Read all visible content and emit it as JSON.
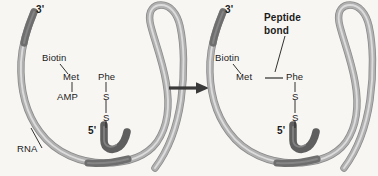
{
  "figure": {
    "background_color": "#f7f6f3",
    "strand_color": "#a9a9a9",
    "strand_highlight_color": "#d8d8d8",
    "strand_dark_color": "#6e6e6e",
    "text_color": "#1b1b1b",
    "arrow_color": "#3a3a3a"
  },
  "arrow": {
    "name": "reaction-arrow",
    "direction": "right"
  },
  "panels": {
    "left": {
      "name": "before-peptide-bond-panel",
      "labels": {
        "three_prime": "3'",
        "five_prime": "5'",
        "rna": "RNA",
        "biotin": "Biotin",
        "met": "Met",
        "amp": "AMP",
        "phe": "Phe",
        "sulfur_upper": "S",
        "sulfur_lower": "S"
      }
    },
    "right": {
      "name": "after-peptide-bond-panel",
      "labels": {
        "three_prime": "3'",
        "five_prime": "5'",
        "peptide_bond_line1": "Peptide",
        "peptide_bond_line2": "bond",
        "biotin": "Biotin",
        "met": "Met",
        "phe": "Phe",
        "sulfur_upper": "S",
        "sulfur_lower": "S"
      }
    }
  }
}
